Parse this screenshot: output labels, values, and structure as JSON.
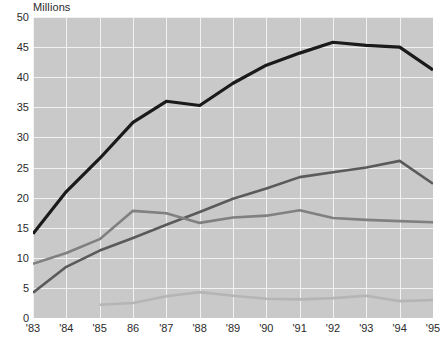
{
  "chart_data": {
    "type": "line",
    "title": "",
    "subtitle": "",
    "unit_label": "Millions",
    "xlabel": "",
    "ylabel": "",
    "grid": true,
    "legend_position": "none",
    "xlim": [
      1983,
      1995
    ],
    "ylim": [
      0,
      50
    ],
    "x": [
      1983,
      1984,
      1985,
      1986,
      1987,
      1988,
      1989,
      1990,
      1991,
      1992,
      1993,
      1994,
      1995
    ],
    "categories": [
      "'83",
      "'84",
      "'85",
      "86",
      "'87",
      "'88",
      "'89",
      "'90",
      "'91",
      "'92",
      "'93",
      "'94",
      "'95"
    ],
    "ytick_values": [
      0,
      5,
      10,
      15,
      20,
      25,
      30,
      35,
      40,
      45,
      50
    ],
    "ytick_labels": [
      "0",
      "5",
      "10",
      "15",
      "20",
      "25",
      "30",
      "35",
      "40",
      "45",
      "50"
    ],
    "series": [
      {
        "name": "series-1",
        "color": "#1a1a1a",
        "width": 3.2,
        "values": [
          14.0,
          21.0,
          26.5,
          32.5,
          36.0,
          35.3,
          39.0,
          42.0,
          44.0,
          45.8,
          45.3,
          45.0,
          41.2
        ]
      },
      {
        "name": "series-2",
        "color": "#5a5a5a",
        "width": 2.6,
        "values": [
          4.2,
          8.5,
          11.2,
          13.3,
          15.5,
          17.6,
          19.8,
          21.5,
          23.4,
          24.2,
          25.0,
          26.1,
          22.3
        ]
      },
      {
        "name": "series-3",
        "color": "#808080",
        "width": 2.6,
        "values": [
          9.0,
          10.8,
          13.1,
          17.8,
          17.4,
          15.8,
          16.7,
          17.0,
          17.9,
          16.6,
          16.3,
          16.1,
          15.9
        ]
      },
      {
        "name": "series-4",
        "color": "#b5b5b5",
        "width": 2.6,
        "values": [
          null,
          null,
          2.2,
          2.5,
          3.6,
          4.3,
          3.7,
          3.2,
          3.1,
          3.3,
          3.7,
          2.8,
          3.0
        ]
      }
    ]
  },
  "colors": {
    "plot_background": "#c9c9c9",
    "gridline": "#f2f2f2",
    "page_background": "#ffffff",
    "text": "#2b2b2b"
  }
}
